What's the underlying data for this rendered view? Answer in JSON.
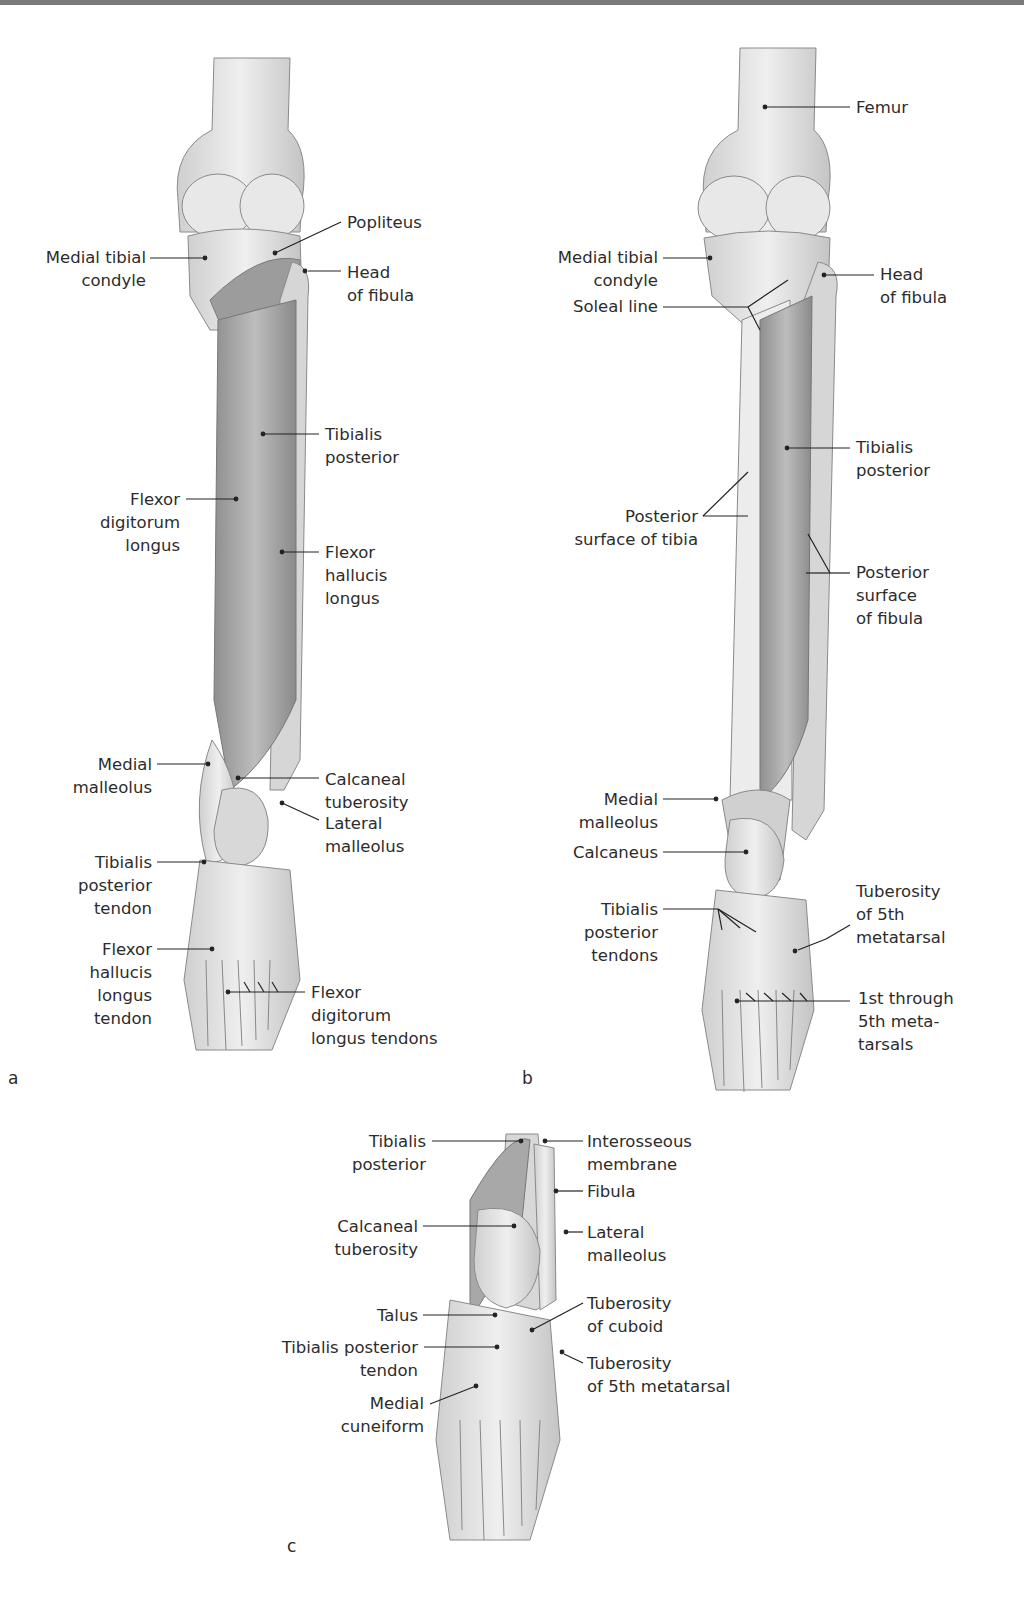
{
  "panels": {
    "a": {
      "letter": "a",
      "labels": {
        "popliteus": "Popliteus",
        "medial_tibial_condyle": "Medial tibial\ncondyle",
        "head_of_fibula": "Head\nof fibula",
        "tibialis_posterior": "Tibialis\nposterior",
        "flexor_digitorum_longus": "Flexor\ndigitorum\nlongus",
        "flexor_hallucis_longus": "Flexor\nhallucis\nlongus",
        "medial_malleolus": "Medial\nmalleolus",
        "calcaneal_tuberosity": "Calcaneal\ntuberosity",
        "lateral_malleolus": "Lateral\nmalleolus",
        "tibialis_posterior_tendon": "Tibialis\nposterior\ntendon",
        "flexor_hallucis_longus_tendon": "Flexor\nhallucis\nlongus\ntendon",
        "flexor_digitorum_longus_tendons": "Flexor\ndigitorum\nlongus tendons"
      }
    },
    "b": {
      "letter": "b",
      "labels": {
        "femur": "Femur",
        "medial_tibial_condyle": "Medial tibial\ncondyle",
        "soleal_line": "Soleal line",
        "head_of_fibula": "Head\nof fibula",
        "tibialis_posterior": "Tibialis\nposterior",
        "posterior_surface_of_tibia": "Posterior\nsurface of tibia",
        "posterior_surface_of_fibula": "Posterior\nsurface\nof fibula",
        "medial_malleolus": "Medial\nmalleolus",
        "calcaneus": "Calcaneus",
        "tibialis_posterior_tendons": "Tibialis\nposterior\ntendons",
        "tuberosity_of_5th_metatarsal": "Tuberosity\nof 5th\nmetatarsal",
        "metatarsals": "1st through\n5th meta-\ntarsals"
      }
    },
    "c": {
      "letter": "c",
      "labels": {
        "tibialis_posterior": "Tibialis\nposterior",
        "interosseous_membrane": "Interosseous\nmembrane",
        "fibula": "Fibula",
        "calcaneal_tuberosity": "Calcaneal\ntuberosity",
        "lateral_malleolus": "Lateral\nmalleolus",
        "talus": "Talus",
        "tuberosity_of_cuboid": "Tuberosity\nof cuboid",
        "tibialis_posterior_tendon": "Tibialis posterior\ntendon",
        "tuberosity_of_5th_metatarsal": "Tuberosity\nof 5th metatarsal",
        "medial_cuneiform": "Medial\ncuneiform"
      }
    }
  },
  "colors": {
    "bone_fill": "#e2e2e2",
    "bone_stroke": "#8a8a8a",
    "muscle_fill": "#a9a9a9",
    "leader_line": "#222222",
    "text": "#2c2c2c"
  }
}
